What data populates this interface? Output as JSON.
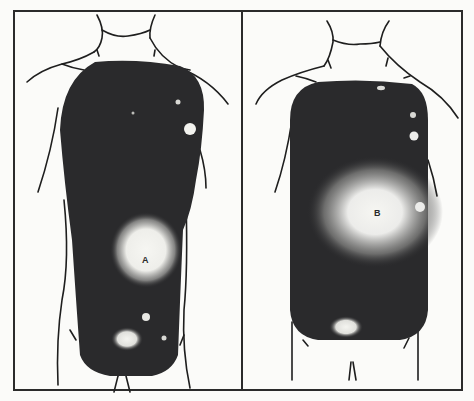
{
  "figure": {
    "panels": [
      {
        "id": "left",
        "label": "A",
        "description": "Anterior torso outline with dark scan region; large bright hotspot A in lower right abdomen, small bright spot upper right chest, small spots in lower abdomen"
      },
      {
        "id": "right",
        "label": "B",
        "description": "Anterior torso outline with dark scan region; large diffuse bright hotspot B in mid-right chest/abdomen, small bright spots along right edge, bright patch at lower abdomen"
      }
    ],
    "colors": {
      "background": "#fbfbf9",
      "frame": "#2b2b2b",
      "scan_dark": "#2a2a2c",
      "hotspot": "#f2f2ee",
      "outline": "#1e1e1e"
    }
  }
}
